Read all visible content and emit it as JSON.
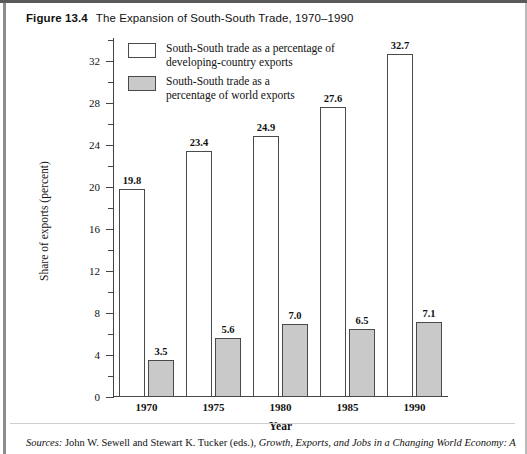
{
  "caption": {
    "figure_number": "Figure 13.4",
    "title": "The Expansion of South-South Trade, 1970–1990"
  },
  "legend": {
    "position": "inside-top-left",
    "items": [
      {
        "swatch": "white",
        "label": "South-South trade as a percentage of\ndeveloping-country exports"
      },
      {
        "swatch": "gray",
        "label": "South-South trade as a\npercentage of world exports"
      }
    ]
  },
  "footer": {
    "source_prefix": "Sources:",
    "source_text_1": " John W. Sewell and Stewart K. Tucker (eds.), ",
    "source_text_italic": "Growth, Exports, and Jobs in a Changing World Economy: Agenda"
  },
  "colors": {
    "bar_white": "#ffffff",
    "bar_gray": "#c9c9c9",
    "bar_border": "#4a4a4a",
    "axis": "#444444",
    "text": "#111111",
    "page_border_top": "#5a5a5a"
  },
  "chart_data": {
    "type": "bar",
    "title": "The Expansion of South-South Trade, 1970–1990",
    "xlabel": "Year",
    "ylabel": "Share of exports (percent)",
    "categories": [
      "1970",
      "1975",
      "1980",
      "1985",
      "1990"
    ],
    "series": [
      {
        "name": "South-South trade as a percentage of developing-country exports",
        "swatch": "white",
        "values": [
          19.8,
          23.4,
          24.9,
          27.6,
          32.7
        ]
      },
      {
        "name": "South-South trade as a percentage of world exports",
        "swatch": "gray",
        "values": [
          3.5,
          5.6,
          7.0,
          6.5,
          7.1
        ]
      }
    ],
    "ylim": [
      0,
      34.2
    ],
    "ytick_major": [
      0,
      4,
      8,
      12,
      16,
      20,
      24,
      28,
      32
    ],
    "ytick_minor": [
      2,
      6,
      10,
      14,
      18,
      22,
      26,
      30,
      34
    ],
    "ytick_labels": [
      "0",
      "4",
      "8",
      "12",
      "16",
      "20",
      "24",
      "28",
      "32"
    ],
    "grid": false,
    "data_labels": true,
    "legend_position": "upper-left-inside"
  }
}
